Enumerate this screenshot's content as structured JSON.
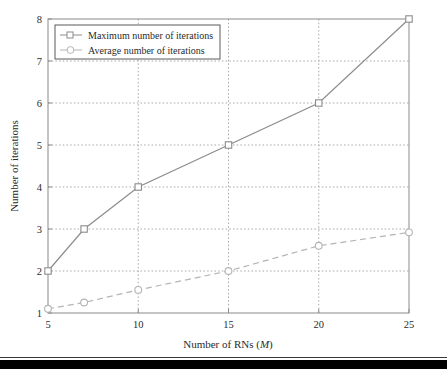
{
  "chart_data": {
    "type": "line",
    "title": "",
    "xlabel": "Number of RNs (M)",
    "xlabel_plain": "Number of RNs (",
    "xlabel_var": "M",
    "xlabel_tail": ")",
    "ylabel": "Number of iterations",
    "xlim": [
      5,
      25
    ],
    "ylim": [
      1,
      8
    ],
    "xticks": [
      5,
      10,
      15,
      20,
      25
    ],
    "yticks": [
      1,
      2,
      3,
      4,
      5,
      6,
      7,
      8
    ],
    "xtick_labels": [
      "5",
      "10",
      "15",
      "20",
      "25"
    ],
    "ytick_labels": [
      "1",
      "2",
      "3",
      "4",
      "5",
      "6",
      "7",
      "8"
    ],
    "grid": true,
    "grid_style": "dotted",
    "legend_position": "upper left",
    "x": [
      5,
      7,
      10,
      15,
      20,
      25
    ],
    "series": [
      {
        "name": "Maximum number of iterations",
        "values": [
          2,
          3,
          4,
          5,
          6,
          8
        ],
        "marker": "square",
        "linestyle": "solid",
        "color": "#8c8c8c"
      },
      {
        "name": "Average number of iterations",
        "values": [
          1.1,
          1.25,
          1.55,
          2.0,
          2.6,
          2.92
        ],
        "marker": "circle",
        "linestyle": "dashed",
        "color": "#b4b4b4"
      }
    ]
  },
  "legend": {
    "items": [
      {
        "label": "Maximum number of iterations",
        "marker": "square-marker",
        "linestyle": "solid"
      },
      {
        "label": "Average number of iterations",
        "marker": "circle-marker",
        "linestyle": "dashed"
      }
    ]
  },
  "axes": {
    "x_title_prefix": "Number of RNs (",
    "x_title_var": "M",
    "x_title_suffix": ")",
    "y_title": "Number of iterations"
  },
  "colors": {
    "background": "#ffffff",
    "axis": "#8a8a8a",
    "grid": "#a8a8a8",
    "max_series": "#8c8c8c",
    "avg_series": "#b4b4b4",
    "text": "#2b2b2b",
    "bottom_band": "#000000"
  }
}
